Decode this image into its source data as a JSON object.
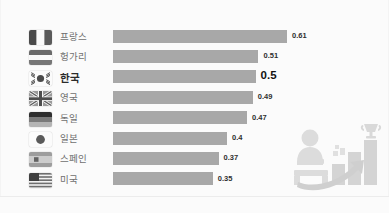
{
  "meta": {
    "watermark": "",
    "accent_bar_color": "#a8a8a8",
    "highlight_text_color": "#111111",
    "label_text_color": "#6f6f6f",
    "background_color": "#fbfbfb"
  },
  "chart_data": {
    "type": "bar",
    "title": "",
    "subtitle": "",
    "xlabel": "",
    "ylabel": "",
    "orientation": "horizontal",
    "grid": false,
    "legend": "none",
    "xlim": [
      0,
      0.61
    ],
    "categories": [
      "프랑스",
      "헝가리",
      "한국",
      "영국",
      "독일",
      "일본",
      "스페인",
      "미국"
    ],
    "values": [
      0.61,
      0.51,
      0.5,
      0.49,
      0.47,
      0.4,
      0.37,
      0.35
    ],
    "value_labels": [
      "0.61",
      "0.51",
      "0.5",
      "0.49",
      "0.47",
      "0.4",
      "0.37",
      "0.35"
    ],
    "highlight_index": 2,
    "flags": [
      "france-flag",
      "hungary-flag",
      "south-korea-flag",
      "united-kingdom-flag",
      "germany-flag",
      "japan-flag",
      "spain-flag",
      "united-states-flag"
    ]
  },
  "rows": [
    {
      "country": "프랑스",
      "value_label": "0.61",
      "value": 0.61,
      "flag": "france-flag",
      "highlight": false
    },
    {
      "country": "헝가리",
      "value_label": "0.51",
      "value": 0.51,
      "flag": "hungary-flag",
      "highlight": false
    },
    {
      "country": "한국",
      "value_label": "0.5",
      "value": 0.5,
      "flag": "south-korea-flag",
      "highlight": true
    },
    {
      "country": "영국",
      "value_label": "0.49",
      "value": 0.49,
      "flag": "united-kingdom-flag",
      "highlight": false
    },
    {
      "country": "독일",
      "value_label": "0.47",
      "value": 0.47,
      "flag": "germany-flag",
      "highlight": false
    },
    {
      "country": "일본",
      "value_label": "0.4",
      "value": 0.4,
      "flag": "japan-flag",
      "highlight": false
    },
    {
      "country": "스페인",
      "value_label": "0.37",
      "value": 0.37,
      "flag": "spain-flag",
      "highlight": false
    },
    {
      "country": "미국",
      "value_label": "0.35",
      "value": 0.35,
      "flag": "united-states-flag",
      "highlight": false
    }
  ],
  "illustration": {
    "name": "person-growth-chart-trophy-illustration",
    "elements": [
      "person-at-desk",
      "ascending-bars",
      "growth-arrow",
      "trophy"
    ]
  }
}
